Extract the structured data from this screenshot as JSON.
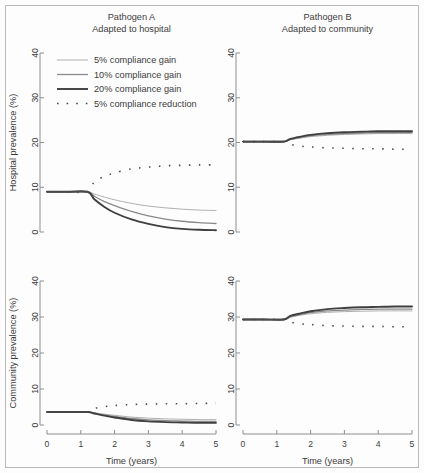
{
  "figure": {
    "background": "#fdfdfd",
    "frame_color": "#b9b9b9",
    "axis_color": "#8e8e8e"
  },
  "legend": {
    "position": "top-left panel, inside",
    "items": [
      {
        "label": "5% compliance gain",
        "style": "solid",
        "color": "#b0b0b0",
        "width": 1.0
      },
      {
        "label": "10% compliance gain",
        "style": "solid",
        "color": "#8a8a8a",
        "width": 1.3
      },
      {
        "label": "20% compliance gain",
        "style": "solid",
        "color": "#3f3f3f",
        "width": 1.9
      },
      {
        "label": "5% compliance reduction",
        "style": "dotted",
        "color": "#4a4a4a",
        "width": 1.6
      }
    ]
  },
  "axes": {
    "x": {
      "label": "Time (years)",
      "ticks": [
        0,
        1,
        2,
        3,
        4,
        5
      ],
      "min": 0,
      "max": 5
    },
    "y_top": {
      "label": "Hospital prevalence (%)",
      "ticks": [
        0,
        10,
        20,
        30,
        40
      ],
      "min": 0,
      "max": 40
    },
    "y_bottom": {
      "label": "Community prevalence (%)",
      "ticks": [
        0,
        10,
        20,
        30,
        40
      ],
      "min": 0,
      "max": 40
    }
  },
  "columns": [
    {
      "id": "A",
      "title_line1": "Pathogen A",
      "title_line2": "Adapted to hospital"
    },
    {
      "id": "B",
      "title_line1": "Pathogen B",
      "title_line2": "Adapted to community"
    }
  ],
  "chart_data": {
    "type": "line",
    "xlabel": "Time (years)",
    "xlim": [
      0,
      5
    ],
    "ylim": [
      0,
      40
    ],
    "grid": false,
    "legend_position": "upper-left of panel A top",
    "intervention_start_year": 1.2,
    "panels": [
      {
        "panel": "A-hospital",
        "column": "Pathogen A",
        "row": "Hospital prevalence (%)",
        "ylabel": "Hospital prevalence (%)",
        "baseline_value": 9.0,
        "x": [
          0,
          0.6,
          1.2,
          1.4,
          1.7,
          2.0,
          2.5,
          3.0,
          3.5,
          4.0,
          4.5,
          5.0
        ],
        "series": [
          {
            "name": "5% compliance gain",
            "values": [
              9.0,
              9.0,
              9.0,
              8.5,
              7.8,
              7.2,
              6.4,
              5.8,
              5.4,
              5.1,
              4.9,
              4.8
            ]
          },
          {
            "name": "10% compliance gain",
            "values": [
              9.0,
              9.0,
              9.0,
              8.0,
              6.8,
              5.9,
              4.6,
              3.6,
              2.9,
              2.4,
              2.1,
              1.9
            ]
          },
          {
            "name": "20% compliance gain",
            "values": [
              9.0,
              9.0,
              9.0,
              7.3,
              5.6,
              4.3,
              2.8,
              1.8,
              1.1,
              0.7,
              0.5,
              0.4
            ]
          },
          {
            "name": "5% compliance reduction",
            "values": [
              9.0,
              9.0,
              9.0,
              11.2,
              12.4,
              13.2,
              14.1,
              14.5,
              14.8,
              14.9,
              15.0,
              15.0
            ]
          }
        ]
      },
      {
        "panel": "B-hospital",
        "column": "Pathogen B",
        "row": "Hospital prevalence (%)",
        "ylabel": "Hospital prevalence (%)",
        "baseline_value": 20.2,
        "x": [
          0,
          0.6,
          1.2,
          1.4,
          1.7,
          2.0,
          2.5,
          3.0,
          3.5,
          4.0,
          4.5,
          5.0
        ],
        "series": [
          {
            "name": "5% compliance gain",
            "values": [
              20.2,
              20.2,
              20.2,
              20.6,
              21.0,
              21.3,
              21.6,
              21.8,
              21.9,
              22.0,
              22.0,
              22.0
            ]
          },
          {
            "name": "10% compliance gain",
            "values": [
              20.2,
              20.2,
              20.2,
              20.7,
              21.1,
              21.5,
              21.8,
              22.0,
              22.1,
              22.2,
              22.2,
              22.2
            ]
          },
          {
            "name": "20% compliance gain",
            "values": [
              20.2,
              20.2,
              20.2,
              20.8,
              21.3,
              21.7,
              22.1,
              22.3,
              22.4,
              22.5,
              22.5,
              22.5
            ]
          },
          {
            "name": "5% compliance reduction",
            "values": [
              20.2,
              20.2,
              20.2,
              19.6,
              19.2,
              19.0,
              18.8,
              18.7,
              18.6,
              18.6,
              18.5,
              18.5
            ]
          }
        ]
      },
      {
        "panel": "A-community",
        "column": "Pathogen A",
        "row": "Community prevalence (%)",
        "ylabel": "Community prevalence (%)",
        "baseline_value": 3.6,
        "x": [
          0,
          0.6,
          1.2,
          1.4,
          1.7,
          2.0,
          2.5,
          3.0,
          3.5,
          4.0,
          4.5,
          5.0
        ],
        "series": [
          {
            "name": "5% compliance gain",
            "values": [
              3.6,
              3.6,
              3.6,
              3.4,
              3.0,
              2.7,
              2.2,
              1.9,
              1.7,
              1.6,
              1.5,
              1.5
            ]
          },
          {
            "name": "10% compliance gain",
            "values": [
              3.6,
              3.6,
              3.6,
              3.3,
              2.8,
              2.4,
              1.8,
              1.4,
              1.2,
              1.1,
              1.0,
              1.0
            ]
          },
          {
            "name": "20% compliance gain",
            "values": [
              3.6,
              3.6,
              3.6,
              3.2,
              2.6,
              2.1,
              1.4,
              1.0,
              0.8,
              0.7,
              0.6,
              0.6
            ]
          },
          {
            "name": "5% compliance reduction",
            "values": [
              3.6,
              3.6,
              3.6,
              4.6,
              5.1,
              5.4,
              5.7,
              5.8,
              5.9,
              5.9,
              6.0,
              6.0
            ]
          }
        ]
      },
      {
        "panel": "B-community",
        "column": "Pathogen B",
        "row": "Community prevalence (%)",
        "ylabel": "Community prevalence (%)",
        "baseline_value": 29.3,
        "x": [
          0,
          0.6,
          1.2,
          1.4,
          1.7,
          2.0,
          2.5,
          3.0,
          3.5,
          4.0,
          4.5,
          5.0
        ],
        "series": [
          {
            "name": "5% compliance gain",
            "values": [
              29.3,
              29.3,
              29.3,
              29.9,
              30.5,
              30.9,
              31.3,
              31.5,
              31.6,
              31.7,
              31.7,
              31.7
            ]
          },
          {
            "name": "10% compliance gain",
            "values": [
              29.3,
              29.3,
              29.3,
              30.1,
              30.7,
              31.2,
              31.7,
              31.9,
              32.1,
              32.2,
              32.2,
              32.2
            ]
          },
          {
            "name": "20% compliance gain",
            "values": [
              29.3,
              29.3,
              29.3,
              30.3,
              31.0,
              31.6,
              32.2,
              32.5,
              32.7,
              32.8,
              32.9,
              32.9
            ]
          },
          {
            "name": "5% compliance reduction",
            "values": [
              29.3,
              29.3,
              29.3,
              28.6,
              28.1,
              27.9,
              27.6,
              27.5,
              27.4,
              27.4,
              27.3,
              27.3
            ]
          }
        ]
      }
    ]
  }
}
